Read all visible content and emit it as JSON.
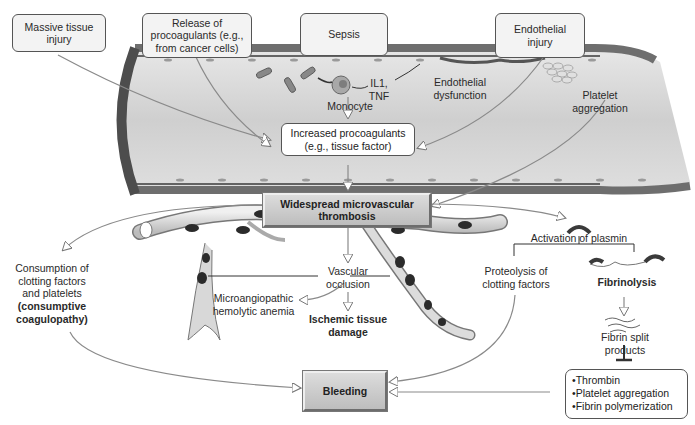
{
  "diagram": {
    "triggers": [
      {
        "id": "massive-tissue-injury",
        "label": "Massive tissue\ninjury"
      },
      {
        "id": "release-procoagulants",
        "label": "Release of\nprocoagulants (e.g.,\nfrom cancer cells)"
      },
      {
        "id": "sepsis",
        "label": "Sepsis"
      },
      {
        "id": "endothelial-injury",
        "label": "Endothelial\ninjury"
      }
    ],
    "vessel_labels": {
      "monocyte": "Monocyte",
      "cytokines": "IL1,\nTNF",
      "endothelial_dysfunction": "Endothelial\ndysfunction",
      "platelet_aggregation": "Platelet\naggregation"
    },
    "increased_procoagulants": "Increased procoagulants\n(e.g., tissue factor)",
    "widespread_thrombosis": "Widespread microvascular\nthrombosis",
    "consumption": {
      "line1": "Consumption of\nclotting factors\nand platelets",
      "line2": "(consumptive\ncoagulopathy)"
    },
    "vascular_occlusion": "Vascular\nocclusion",
    "microangiopathic": "Microangiopathic\nhemolytic anemia",
    "ischemic_damage": "Ischemic tissue\ndamage",
    "activation_plasmin": "Activation of plasmin",
    "proteolysis": "Proteolysis of\nclotting factors",
    "fibrinolysis": "Fibrinolysis",
    "fibrin_split": "Fibrin split\nproducts",
    "inhibited": [
      "Thrombin",
      "Platelet aggregation",
      "Fibrin polymerization"
    ],
    "bleeding": "Bleeding"
  },
  "colors": {
    "vessel_fill": "#d4d4d4",
    "vessel_wall": "#7a7a7a",
    "box_fill": "#f3f3f3",
    "bevel_fill": "#c8c8c8",
    "arrow": "#8a8a8a",
    "clot": "#2b2b2b"
  }
}
